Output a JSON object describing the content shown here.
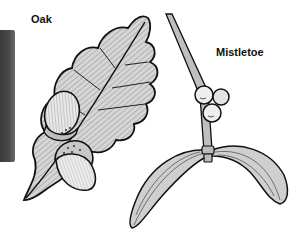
{
  "illustration": {
    "style": "black-and-white hand-drawn botanical engraving",
    "labels": {
      "oak": "Oak",
      "mistletoe": "Mistletoe"
    },
    "subjects": [
      {
        "name": "oak-leaf",
        "description": "lobed oak leaf with hatched shading"
      },
      {
        "name": "acorns",
        "count": 2,
        "description": "two acorns with textured cups"
      },
      {
        "name": "mistletoe-sprig",
        "description": "diagonal stem with berry cluster"
      },
      {
        "name": "mistletoe-berries",
        "count": 3
      },
      {
        "name": "mistletoe-leaves",
        "count": 2,
        "description": "two long curved leaves"
      }
    ],
    "colors": {
      "ink": "#111111",
      "leaf_fill": "#d4d4d4",
      "berry_fill": "#eeeeee",
      "background": "#ffffff",
      "strip": "#444444"
    }
  }
}
